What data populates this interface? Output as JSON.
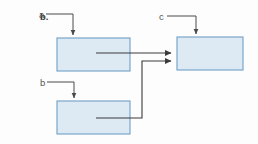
{
  "figure": {
    "panel_label": "b.",
    "background_color": "#fdfdfd",
    "box_fill_color": "#dde9f3",
    "box_border_color": "#6f9fc6",
    "line_color": "#3b3b3b",
    "callout_color": "#4a4a4a"
  },
  "nodes": [
    {
      "id": "a",
      "label": "a",
      "x": 57,
      "y": 38,
      "width": 73,
      "height": 33,
      "label_x": 40,
      "label_y": 18,
      "callout_points": "46,14 73,14 73,35",
      "arrow_into_top": true
    },
    {
      "id": "b",
      "label": "b",
      "x": 57,
      "y": 101,
      "width": 73,
      "height": 33,
      "label_x": 40,
      "label_y": 86,
      "callout_points": "47,82 74,82 74,98",
      "arrow_into_top": true
    },
    {
      "id": "c",
      "label": "c",
      "x": 177,
      "y": 37,
      "width": 66,
      "height": 33,
      "label_x": 159,
      "label_y": 20,
      "callout_points": "167,16 196,16 196,34",
      "arrow_into_top": true
    }
  ],
  "edges": [
    {
      "id": "a-to-c",
      "from": "a",
      "to": "c",
      "points": "96,53 171,53",
      "description": "horizontal arrow from box a to box c"
    },
    {
      "id": "b-to-c",
      "from": "b",
      "to": "c",
      "points": "96,118 142,118 142,61 171,61",
      "description": "elbow arrow from box b up and right into box c"
    }
  ],
  "arrowheads": {
    "style": "solid-triangle",
    "size": 7
  }
}
